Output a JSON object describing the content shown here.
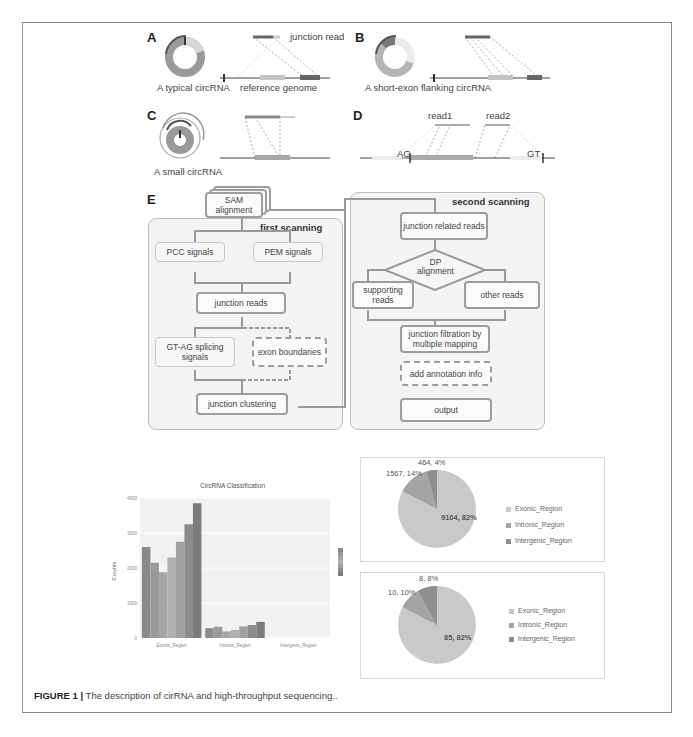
{
  "figure": {
    "caption_label": "FIGURE 1 |",
    "caption_text": "The description of cirRNA and high-throughput sequencing.."
  },
  "panels": {
    "A": {
      "label": "A",
      "caption": "A typical circRNA",
      "read_label": "junction read",
      "genome_label": "reference genome"
    },
    "B": {
      "label": "B",
      "caption": "A short-exon flanking circRNA"
    },
    "C": {
      "label": "C",
      "caption": "A small circRNA"
    },
    "D": {
      "label": "D",
      "read1": "read1",
      "read2": "read2",
      "left_site": "AG",
      "right_site": "GT"
    },
    "E": {
      "label": "E",
      "input": "SAM alignment",
      "first_scanning": {
        "title": "first scanning",
        "pcc": "PCC signals",
        "pem": "PEM signals",
        "junction_reads": "junction reads",
        "gtag": "GT-AG splicing signals",
        "exon_boundaries": "exon boundaries",
        "clustering": "junction clustering"
      },
      "second_scanning": {
        "title": "second scanning",
        "related": "junction related reads",
        "dp": "DP alignment",
        "supporting": "supporting reads",
        "other": "other reads",
        "filtration": "junction filtration by multiple mapping",
        "annotation": "add annotation info",
        "output": "output"
      }
    }
  },
  "chart_data": [
    {
      "type": "bar",
      "title": "CircRNA Classification",
      "xlabel": "",
      "ylabel": "Counts",
      "ylim": [
        0,
        4000
      ],
      "yticks": [
        "0",
        "1000",
        "2000",
        "3000",
        "4000"
      ],
      "categories": [
        "Exonic_Region",
        "Intronic_Region",
        "Intergenic_Region"
      ],
      "series": [
        {
          "name": "s1",
          "values": [
            2600,
            280,
            0
          ]
        },
        {
          "name": "s2",
          "values": [
            2150,
            320,
            0
          ]
        },
        {
          "name": "s3",
          "values": [
            1880,
            190,
            0
          ]
        },
        {
          "name": "s4",
          "values": [
            2300,
            230,
            0
          ]
        },
        {
          "name": "s5",
          "values": [
            2750,
            330,
            0
          ]
        },
        {
          "name": "s6",
          "values": [
            3250,
            370,
            0
          ]
        },
        {
          "name": "s7",
          "values": [
            3850,
            460,
            0
          ]
        }
      ],
      "grid": true,
      "legend_position": "right"
    },
    {
      "type": "pie",
      "labels": [
        "Exonic_Region",
        "Intronic_Region",
        "Intergenic_Region"
      ],
      "values": [
        9104,
        1567,
        464
      ],
      "data_labels": [
        "9104, 82%",
        "1567, 14%",
        "464, 4%"
      ],
      "legend_position": "right"
    },
    {
      "type": "pie",
      "labels": [
        "Exonic_Region",
        "Intronic_Region",
        "Intergenic_Region"
      ],
      "values": [
        85,
        10,
        8
      ],
      "data_labels": [
        "85, 82%",
        "10, 10%",
        "8, 8%"
      ],
      "legend_position": "right"
    }
  ],
  "colors": {
    "exonic": "#c9c9c9",
    "intronic": "#a4a4a4",
    "intergenic": "#8f8f8f",
    "bars": [
      "#8a8a8a",
      "#9a9a9a",
      "#a6a6a6",
      "#b0b0b0",
      "#a0a0a0",
      "#8c8c8c",
      "#7c7c7c"
    ]
  }
}
